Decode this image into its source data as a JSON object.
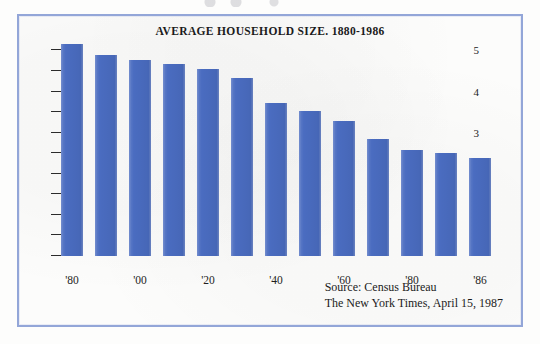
{
  "chart_data": {
    "type": "bar",
    "title": "AVERAGE HOUSEHOLD SIZE. 1880-1986",
    "xlabel": "",
    "ylabel": "",
    "ylim": [
      0,
      5.4
    ],
    "grid": false,
    "legend": "none",
    "bar_color": "#4a6cc0",
    "categories": [
      "1880",
      "1890",
      "1900",
      "1910",
      "1920",
      "1930",
      "1940",
      "1950",
      "1960",
      "1970",
      "1980",
      "1983",
      "1986"
    ],
    "values": [
      5.15,
      4.88,
      4.78,
      4.68,
      4.55,
      4.34,
      3.72,
      3.52,
      3.29,
      2.85,
      2.58,
      2.5,
      2.38
    ],
    "y_ticks_major": [
      1,
      2,
      3,
      4,
      5
    ],
    "y_tick_labels_major": [
      "1",
      "2",
      "3",
      "4",
      "5"
    ],
    "y_ticks_minor": [
      0,
      0.5,
      1.5,
      2.5,
      3.5,
      4.5
    ],
    "x_tick_labels": [
      {
        "label": "'80",
        "index": 0
      },
      {
        "label": "'00",
        "index": 2
      },
      {
        "label": "'20",
        "index": 4
      },
      {
        "label": "'40",
        "index": 6
      },
      {
        "label": "'60",
        "index": 8
      },
      {
        "label": "'80",
        "index": 10
      },
      {
        "label": "'86",
        "index": 12
      }
    ]
  },
  "footer": {
    "source_line_1": "Source: Census Bureau",
    "source_line_2": "The New York Times, April 15, 1987"
  },
  "colors": {
    "bar": "#4a6cc0",
    "frame_border": "#93a6d8",
    "paper": "#fcfcfb",
    "text": "#1b1b1b"
  }
}
